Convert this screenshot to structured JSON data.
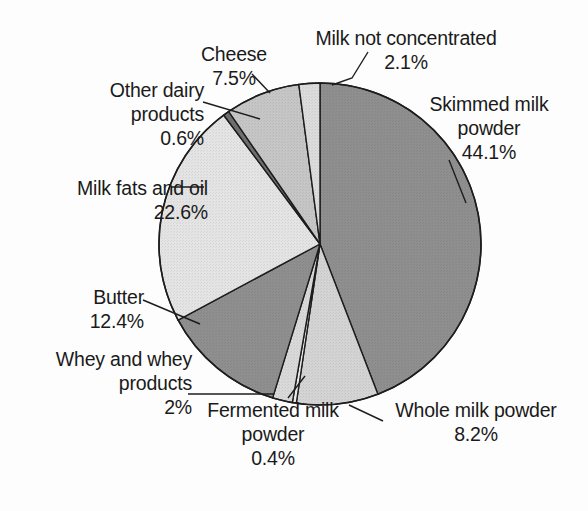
{
  "chart_data": {
    "type": "pie",
    "title": "",
    "subtitle": "",
    "xlabel": "",
    "ylabel": "",
    "legend_position": "none",
    "grid": false,
    "units": "percent",
    "start_angle_deg": 0,
    "direction": "clockwise",
    "categories": [
      "Skimmed milk powder",
      "Whole milk powder",
      "Fermented milk powder",
      "Whey and whey products",
      "Butter",
      "Milk fats and oil",
      "Other dairy products",
      "Cheese",
      "Milk not concentrated"
    ],
    "values": [
      44.1,
      8.2,
      0.4,
      2.0,
      12.4,
      22.6,
      0.6,
      7.5,
      2.1
    ],
    "value_labels": [
      "44.1%",
      "8.2%",
      "0.4%",
      "2%",
      "12.4%",
      "22.6%",
      "0.6%",
      "7.5%",
      "2.1%"
    ],
    "slice_fills": [
      "#8f8f8f",
      "#d4d4d4",
      "#ededed",
      "#d9d9d9",
      "#8f8f8f",
      "#e4e4e4",
      "#6f6f6f",
      "#c6c6c6",
      "#dcdcdc"
    ],
    "slices": [
      {
        "name": "skimmed-milk-powder",
        "label": "Skimmed milk powder",
        "value": 44.1,
        "value_label": "44.1%",
        "fill": "#8f8f8f"
      },
      {
        "name": "whole-milk-powder",
        "label": "Whole milk powder",
        "value": 8.2,
        "value_label": "8.2%",
        "fill": "#d4d4d4"
      },
      {
        "name": "fermented-milk-powder",
        "label": "Fermented milk powder",
        "value": 0.4,
        "value_label": "0.4%",
        "fill": "#ededed"
      },
      {
        "name": "whey-and-whey-products",
        "label": "Whey and whey products",
        "value": 2.0,
        "value_label": "2%",
        "fill": "#d9d9d9"
      },
      {
        "name": "butter",
        "label": "Butter",
        "value": 12.4,
        "value_label": "12.4%",
        "fill": "#8f8f8f"
      },
      {
        "name": "milk-fats-and-oil",
        "label": "Milk fats and oil",
        "value": 22.6,
        "value_label": "22.6%",
        "fill": "#e4e4e4"
      },
      {
        "name": "other-dairy-products",
        "label": "Other dairy products",
        "value": 0.6,
        "value_label": "0.6%",
        "fill": "#6f6f6f"
      },
      {
        "name": "cheese",
        "label": "Cheese",
        "value": 7.5,
        "value_label": "7.5%",
        "fill": "#c6c6c6"
      },
      {
        "name": "milk-not-concentrated",
        "label": "Milk not concentrated",
        "value": 2.1,
        "value_label": "2.1%",
        "fill": "#dcdcdc"
      }
    ]
  },
  "labels": {
    "milk_not_concentrated": {
      "name": "Milk not concentrated",
      "pct": "2.1%"
    },
    "cheese": {
      "name": "Cheese",
      "pct": "7.5%"
    },
    "other_dairy": {
      "line1": "Other dairy",
      "line2": "products",
      "pct": "0.6%"
    },
    "milk_fats": {
      "name": "Milk fats and oil",
      "pct": "22.6%"
    },
    "butter": {
      "name": "Butter",
      "pct": "12.4%"
    },
    "whey": {
      "line1": "Whey and whey",
      "line2": "products",
      "pct": "2%"
    },
    "skimmed": {
      "line1": "Skimmed milk",
      "line2": "powder",
      "pct": "44.1%"
    },
    "whole": {
      "name": "Whole milk powder",
      "pct": "8.2%"
    },
    "fermented": {
      "line1": "Fermented milk",
      "line2": "powder",
      "pct": "0.4%"
    }
  },
  "style": {
    "outline_color": "#1d1d1d",
    "leader_color": "#1d1d1d",
    "background": "#ffffff",
    "text_color": "#1a1a1a"
  }
}
